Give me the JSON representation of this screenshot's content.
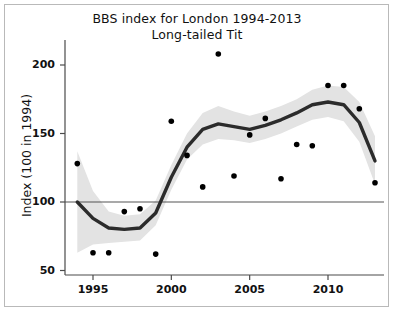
{
  "figure": {
    "title_lines": [
      "BBS index for London 1994-2013",
      "Long-tailed Tit"
    ],
    "ylabel": "Index (100 in 1994)"
  },
  "chart_data": {
    "type": "scatter",
    "title": "BBS index for London 1994-2013 Long-tailed Tit",
    "subtitle": "Long-tailed Tit",
    "xlabel": "",
    "ylabel": "Index (100 in 1994)",
    "xlim": [
      1993.5,
      2013.8
    ],
    "ylim": [
      42,
      215
    ],
    "xticks": [
      1995,
      2000,
      2005,
      2010
    ],
    "xticklabels": [
      "1995",
      "2000",
      "2005",
      "2010"
    ],
    "yticks": [
      50,
      100,
      150,
      200
    ],
    "yticklabels": [
      "50",
      "100",
      "150",
      "200"
    ],
    "grid": false,
    "legend": null,
    "reference_line": {
      "y": 100,
      "color": "#555555",
      "label": ""
    },
    "series": [
      {
        "name": "Annual index",
        "type": "scatter",
        "marker": "circle",
        "color": "#000000",
        "x": [
          1994,
          1995,
          1996,
          1997,
          1998,
          1999,
          2000,
          2001,
          2002,
          2003,
          2004,
          2005,
          2006,
          2007,
          2008,
          2009,
          2010,
          2011,
          2012,
          2013
        ],
        "y": [
          128,
          63,
          63,
          93,
          95,
          62,
          159,
          134,
          111,
          208,
          119,
          149,
          161,
          117,
          142,
          141,
          185,
          185,
          168,
          114
        ]
      },
      {
        "name": "Smoothed trend",
        "type": "line",
        "color": "#2b2b2b",
        "x": [
          1994,
          1995,
          1996,
          1997,
          1998,
          1999,
          2000,
          2001,
          2002,
          2003,
          2004,
          2005,
          2006,
          2007,
          2008,
          2009,
          2010,
          2011,
          2012,
          2013
        ],
        "y": [
          100,
          88,
          81,
          80,
          81,
          92,
          118,
          140,
          153,
          157,
          155,
          153,
          156,
          160,
          165,
          171,
          173,
          171,
          158,
          130
        ]
      },
      {
        "name": "Confidence band upper",
        "type": "band-upper",
        "color": "#e3e3e3",
        "x": [
          1994,
          1995,
          1996,
          1997,
          1998,
          1999,
          2000,
          2001,
          2002,
          2003,
          2004,
          2005,
          2006,
          2007,
          2008,
          2009,
          2010,
          2011,
          2012,
          2013
        ],
        "y": [
          137,
          108,
          93,
          90,
          91,
          101,
          127,
          150,
          165,
          170,
          166,
          163,
          166,
          170,
          175,
          182,
          185,
          184,
          173,
          148
        ]
      },
      {
        "name": "Confidence band lower",
        "type": "band-lower",
        "color": "#e3e3e3",
        "x": [
          1994,
          1995,
          1996,
          1997,
          1998,
          1999,
          2000,
          2001,
          2002,
          2003,
          2004,
          2005,
          2006,
          2007,
          2008,
          2009,
          2010,
          2011,
          2012,
          2013
        ],
        "y": [
          63,
          69,
          70,
          71,
          72,
          83,
          109,
          131,
          142,
          146,
          145,
          143,
          146,
          150,
          155,
          160,
          162,
          159,
          144,
          113
        ]
      }
    ]
  },
  "axes": {
    "y_ticks": [
      {
        "label": "200",
        "value": 200
      },
      {
        "label": "150",
        "value": 150
      },
      {
        "label": "100",
        "value": 100
      },
      {
        "label": "50",
        "value": 50
      }
    ],
    "x_ticks": [
      {
        "label": "1995",
        "value": 1995
      },
      {
        "label": "2000",
        "value": 2000
      },
      {
        "label": "2005",
        "value": 2005
      },
      {
        "label": "2010",
        "value": 2010
      }
    ]
  }
}
